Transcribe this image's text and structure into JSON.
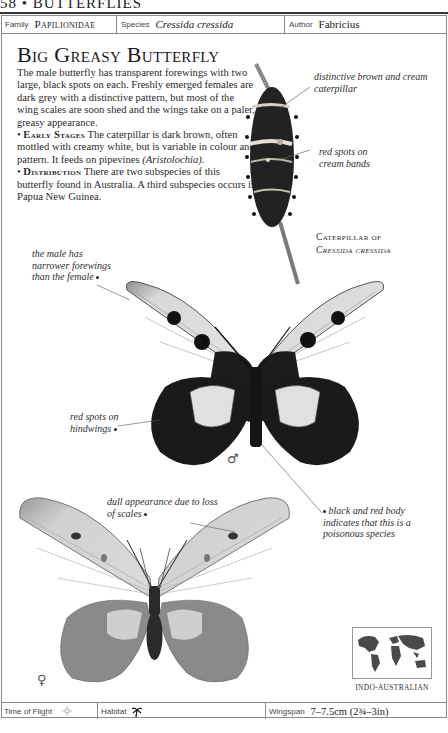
{
  "running_head": "58 • BUTTERFLIES",
  "info_bar": {
    "family_label": "Family",
    "family_value": "Papilionidae",
    "species_label": "Species",
    "species_value": "Cressida cressida",
    "author_label": "Author",
    "author_value": "Fabricius"
  },
  "title": "Big Greasy Butterfly",
  "description": {
    "intro": "The male butterfly has transparent forewings with two large, black spots on each. Freshly emerged females are dark grey with a distinctive pattern, but most of the wing scales are soon shed and the wings take on a paler, greasy appearance.",
    "early_stages_heading": "Early Stages",
    "early_stages_text": "The caterpillar is dark brown, often mottled with creamy white, but is variable in colour and pattern. It feeds on pipevines",
    "early_stages_plant": "(Aristolochia).",
    "distribution_heading": "Distribution",
    "distribution_text": "There are two subspecies of this butterfly found in Australia. A third subspecies occurs in Papua New Guinea."
  },
  "annotations": {
    "caterpillar_color": "distinctive brown and cream caterpillar",
    "red_spots_bands": "red spots on cream bands",
    "male_forewings": "the male has narrower forewings than the female",
    "red_spots_hindwings": "red spots on hindwings",
    "dull_appearance": "dull appearance due to loss of scales",
    "poisonous_body": "black and red body indicates that this is a poisonous species"
  },
  "caterpillar_caption": {
    "line1": "Caterpillar of",
    "line2": "Cressida cressida"
  },
  "symbols": {
    "male": "♂",
    "female": "♀"
  },
  "map": {
    "icon": "world-map-icon",
    "label": "INDO-AUSTRALIAN"
  },
  "footer": {
    "time_of_flight_label": "Time of Flight",
    "time_of_flight_icon": "sun-icon",
    "habitat_label": "Habitat",
    "habitat_icon": "palm-tree-icon",
    "wingspan_label": "Wingspan",
    "wingspan_value": "7–7.5cm (2¾–3in)"
  }
}
